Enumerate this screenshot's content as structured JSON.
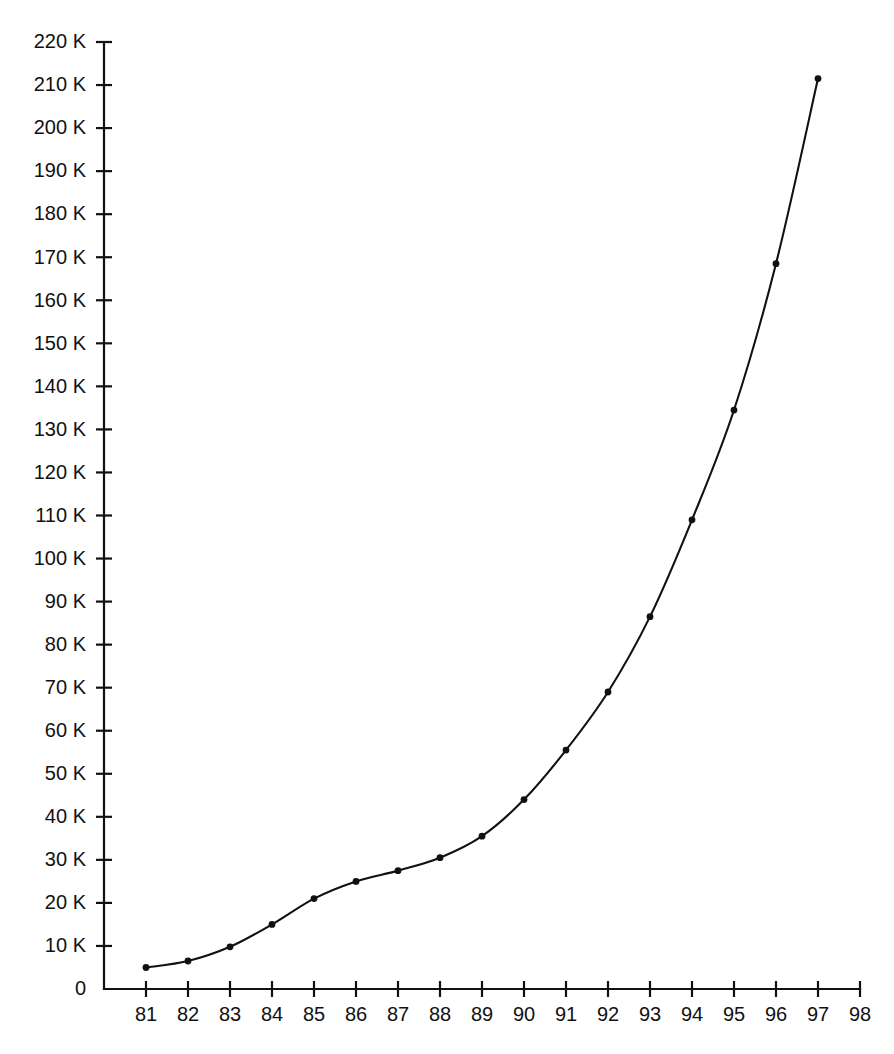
{
  "chart_data": {
    "type": "line",
    "title": "",
    "subtitle": "",
    "xlabel": "",
    "ylabel": "",
    "xlim": [
      80.5,
      98
    ],
    "ylim": [
      0,
      220
    ],
    "grid": false,
    "legend": false,
    "legend_position": "none",
    "units": "K",
    "x": [
      81,
      82,
      83,
      84,
      85,
      86,
      87,
      88,
      89,
      90,
      91,
      92,
      93,
      94,
      95,
      96,
      97
    ],
    "series": [
      {
        "name": "series-1",
        "color": "#111111",
        "marker": "dot",
        "values": [
          5,
          6.5,
          9.8,
          15,
          21,
          25,
          27.5,
          30.5,
          35.5,
          44,
          55.5,
          69,
          86.5,
          109,
          134.5,
          168.5,
          211.5
        ]
      }
    ],
    "x_tick_labels": [
      "81",
      "82",
      "83",
      "84",
      "85",
      "86",
      "87",
      "88",
      "89",
      "90",
      "91",
      "92",
      "93",
      "94",
      "95",
      "96",
      "97",
      "98"
    ],
    "x_tick_values": [
      81,
      82,
      83,
      84,
      85,
      86,
      87,
      88,
      89,
      90,
      91,
      92,
      93,
      94,
      95,
      96,
      97,
      98
    ],
    "y_tick_labels": [
      "0",
      "10 K",
      "20 K",
      "30 K",
      "40 K",
      "50 K",
      "60 K",
      "70 K",
      "80 K",
      "90 K",
      "100 K",
      "110 K",
      "120 K",
      "130 K",
      "140 K",
      "150 K",
      "160 K",
      "170 K",
      "180 K",
      "190 K",
      "200 K",
      "210 K",
      "220 K"
    ],
    "y_tick_values": [
      0,
      10,
      20,
      30,
      40,
      50,
      60,
      70,
      80,
      90,
      100,
      110,
      120,
      130,
      140,
      150,
      160,
      170,
      180,
      190,
      200,
      210,
      220
    ],
    "axis_color": "#111111",
    "background_color": "#ffffff"
  }
}
